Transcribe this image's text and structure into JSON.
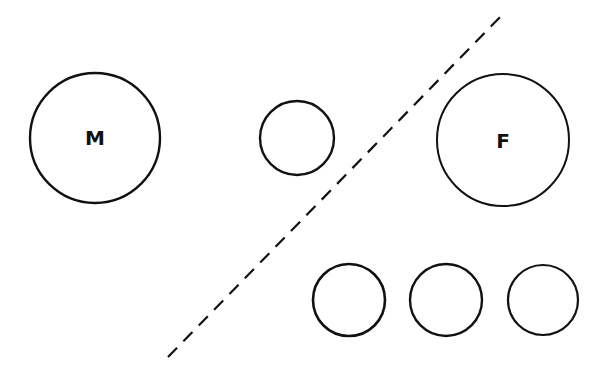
{
  "diagram": {
    "background": "#ffffff",
    "stroke_color": "#111111",
    "nodes": [
      {
        "id": "M",
        "label": "M",
        "cx": 95,
        "cy": 138,
        "r": 65
      },
      {
        "id": "small-left",
        "label": "",
        "cx": 297,
        "cy": 138,
        "r": 37
      },
      {
        "id": "F",
        "label": "F",
        "cx": 503,
        "cy": 140,
        "r": 66
      },
      {
        "id": "bottom-1",
        "label": "",
        "cx": 349,
        "cy": 300,
        "r": 36
      },
      {
        "id": "bottom-2",
        "label": "",
        "cx": 446,
        "cy": 300,
        "r": 36
      },
      {
        "id": "bottom-3",
        "label": "",
        "cx": 543,
        "cy": 300,
        "r": 36
      }
    ],
    "divider": {
      "style": "dashed",
      "x1": 168,
      "y1": 357,
      "x2": 502,
      "y2": 15
    }
  }
}
